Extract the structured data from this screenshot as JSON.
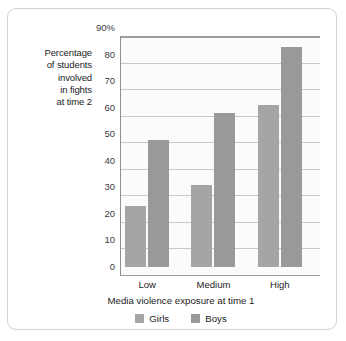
{
  "chart_data": {
    "type": "bar",
    "title": "",
    "categories": [
      "Low",
      "Medium",
      "High"
    ],
    "series": [
      {
        "name": "Girls",
        "values": [
          23,
          31,
          61
        ],
        "color": "#a5a5a5"
      },
      {
        "name": "Boys",
        "values": [
          48,
          58,
          83
        ],
        "color": "#999999"
      }
    ],
    "xlabel": "Media violence exposure at time 1",
    "ylabel": "Percentage of students involved in fights at time 2",
    "ylabel_lines": [
      "Percentage",
      "of students",
      "involved",
      "in fights",
      "at time 2"
    ],
    "ylim": [
      0,
      90
    ],
    "yticks": [
      0,
      10,
      20,
      30,
      40,
      50,
      60,
      70,
      80,
      90
    ],
    "ytick_labels": [
      "0",
      "10",
      "20",
      "30",
      "40",
      "50",
      "60",
      "70",
      "80",
      "90%"
    ],
    "grid": true,
    "legend_position": "bottom",
    "legend": [
      "Girls",
      "Boys"
    ]
  }
}
